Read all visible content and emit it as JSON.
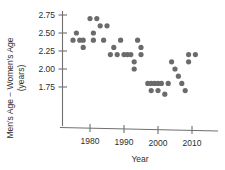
{
  "chart_data": {
    "type": "scatter",
    "title": "",
    "xlabel": "Year",
    "ylabel": "Men's Age − Women's Age (years)",
    "ylabel_line1": "Men's Age − Women's Age",
    "ylabel_line2": "(years)",
    "xlim": [
      1973,
      2013
    ],
    "ylim": [
      1.6,
      2.82
    ],
    "grid": false,
    "legend": null,
    "xticks": [
      1980,
      1990,
      2000,
      2010
    ],
    "xtick_labels": [
      "1980",
      "1990",
      "2000",
      "2010"
    ],
    "yticks": [
      1.75,
      2.0,
      2.25,
      2.5,
      2.75
    ],
    "ytick_labels": [
      "1.75",
      "2.00",
      "2.25",
      "2.50",
      "2.75"
    ],
    "marker": "circle",
    "marker_color": "#6b6b6b",
    "marker_size": 2.6,
    "points": [
      {
        "x": 1975,
        "y": 2.4
      },
      {
        "x": 1976,
        "y": 2.5
      },
      {
        "x": 1977,
        "y": 2.4
      },
      {
        "x": 1978,
        "y": 2.4
      },
      {
        "x": 1978,
        "y": 2.3
      },
      {
        "x": 1980,
        "y": 2.7
      },
      {
        "x": 1981,
        "y": 2.5
      },
      {
        "x": 1981,
        "y": 2.4
      },
      {
        "x": 1982,
        "y": 2.7
      },
      {
        "x": 1983,
        "y": 2.6
      },
      {
        "x": 1984,
        "y": 2.4
      },
      {
        "x": 1985,
        "y": 2.6
      },
      {
        "x": 1986,
        "y": 2.2
      },
      {
        "x": 1987,
        "y": 2.3
      },
      {
        "x": 1988,
        "y": 2.2
      },
      {
        "x": 1989,
        "y": 2.4
      },
      {
        "x": 1990,
        "y": 2.2
      },
      {
        "x": 1991,
        "y": 2.2
      },
      {
        "x": 1992,
        "y": 2.2
      },
      {
        "x": 1993,
        "y": 2.1
      },
      {
        "x": 1993,
        "y": 2.0
      },
      {
        "x": 1994,
        "y": 2.4
      },
      {
        "x": 1995,
        "y": 2.3
      },
      {
        "x": 1995,
        "y": 2.2
      },
      {
        "x": 1997,
        "y": 1.8
      },
      {
        "x": 1998,
        "y": 1.8
      },
      {
        "x": 1998,
        "y": 1.7
      },
      {
        "x": 1999,
        "y": 1.8
      },
      {
        "x": 2000,
        "y": 1.8
      },
      {
        "x": 2000,
        "y": 1.7
      },
      {
        "x": 2001,
        "y": 1.8
      },
      {
        "x": 2002,
        "y": 1.65
      },
      {
        "x": 2003,
        "y": 1.8
      },
      {
        "x": 2004,
        "y": 2.1
      },
      {
        "x": 2005,
        "y": 2.0
      },
      {
        "x": 2006,
        "y": 1.9
      },
      {
        "x": 2007,
        "y": 1.8
      },
      {
        "x": 2008,
        "y": 1.7
      },
      {
        "x": 2009,
        "y": 2.2
      },
      {
        "x": 2009,
        "y": 2.1
      },
      {
        "x": 2011,
        "y": 2.2
      }
    ]
  },
  "axes": {
    "x_axis_name": "year-axis",
    "y_axis_name": "age-difference-axis"
  }
}
